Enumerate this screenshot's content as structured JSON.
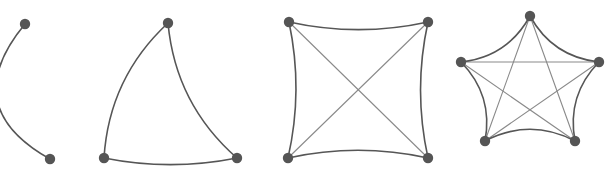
{
  "figure": {
    "background_color": "#ffffff",
    "node_color": "#555555",
    "outer_edge_color": "#565656",
    "chord_edge_color": "#8a8a8a",
    "node_radius": 5.2,
    "outer_edge_width": 1.6,
    "chord_edge_width": 1.1,
    "canvas": {
      "width": 606,
      "height": 179
    }
  },
  "chart_data": {
    "type": "diagram",
    "subtype": "graph-drawing-sequence",
    "xlabel": "",
    "ylabel": "",
    "grid": false,
    "legend": "none",
    "graphs": [
      {
        "name": "K2",
        "order": 2,
        "vertex_count": 2,
        "edge_count": 1,
        "nodes": [
          {
            "id": "a",
            "x": 25,
            "y": 24
          },
          {
            "id": "b",
            "x": 50,
            "y": 159
          }
        ],
        "edges": [
          {
            "from": "a",
            "to": "b",
            "kind": "outer",
            "curvature": 0.3
          }
        ]
      },
      {
        "name": "K3",
        "order": 3,
        "vertex_count": 3,
        "edge_count": 3,
        "nodes": [
          {
            "id": "top",
            "x": 168,
            "y": 23
          },
          {
            "id": "left",
            "x": 104,
            "y": 158
          },
          {
            "id": "right",
            "x": 237,
            "y": 158
          }
        ],
        "edges": [
          {
            "from": "top",
            "to": "left",
            "kind": "outer",
            "curvature": 0.1
          },
          {
            "from": "top",
            "to": "right",
            "kind": "outer",
            "curvature": 0.1
          },
          {
            "from": "left",
            "to": "right",
            "kind": "outer",
            "curvature": 0.05
          }
        ]
      },
      {
        "name": "K4",
        "order": 4,
        "vertex_count": 4,
        "edge_count": 6,
        "nodes": [
          {
            "id": "tl",
            "x": 289,
            "y": 22
          },
          {
            "id": "tr",
            "x": 428,
            "y": 22
          },
          {
            "id": "bl",
            "x": 288,
            "y": 158
          },
          {
            "id": "br",
            "x": 428,
            "y": 158
          }
        ],
        "edges": [
          {
            "from": "tl",
            "to": "tr",
            "kind": "outer",
            "curvature": 0.055
          },
          {
            "from": "tr",
            "to": "br",
            "kind": "outer",
            "curvature": 0.055
          },
          {
            "from": "br",
            "to": "bl",
            "kind": "outer",
            "curvature": 0.055
          },
          {
            "from": "bl",
            "to": "tl",
            "kind": "outer",
            "curvature": 0.055
          },
          {
            "from": "tl",
            "to": "br",
            "kind": "chord",
            "curvature": 0
          },
          {
            "from": "tr",
            "to": "bl",
            "kind": "chord",
            "curvature": 0
          }
        ]
      },
      {
        "name": "K5",
        "order": 5,
        "vertex_count": 5,
        "edge_count": 10,
        "circle": {
          "cx": 530,
          "cy": 89,
          "r": 73
        },
        "nodes": [
          {
            "id": "n0",
            "x": 530,
            "y": 16
          },
          {
            "id": "n1",
            "x": 599,
            "y": 62
          },
          {
            "id": "n2",
            "x": 575,
            "y": 141
          },
          {
            "id": "n3",
            "x": 485,
            "y": 141
          },
          {
            "id": "n4",
            "x": 461,
            "y": 62
          }
        ],
        "edges": [
          {
            "from": "n0",
            "to": "n1",
            "kind": "outer",
            "curvature": 0.13
          },
          {
            "from": "n1",
            "to": "n2",
            "kind": "outer",
            "curvature": 0.13
          },
          {
            "from": "n2",
            "to": "n3",
            "kind": "outer",
            "curvature": 0.13
          },
          {
            "from": "n3",
            "to": "n4",
            "kind": "outer",
            "curvature": 0.13
          },
          {
            "from": "n4",
            "to": "n0",
            "kind": "outer",
            "curvature": 0.13
          },
          {
            "from": "n0",
            "to": "n2",
            "kind": "chord",
            "curvature": 0
          },
          {
            "from": "n0",
            "to": "n3",
            "kind": "chord",
            "curvature": 0
          },
          {
            "from": "n1",
            "to": "n3",
            "kind": "chord",
            "curvature": 0
          },
          {
            "from": "n1",
            "to": "n4",
            "kind": "chord",
            "curvature": 0
          },
          {
            "from": "n2",
            "to": "n4",
            "kind": "chord",
            "curvature": 0
          }
        ]
      }
    ]
  }
}
